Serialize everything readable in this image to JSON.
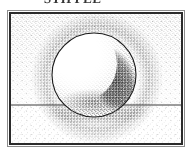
{
  "figure": {
    "title_fragment": "STIPPLE",
    "frame": {
      "x": 7,
      "y": 10,
      "width": 178,
      "height": 137,
      "outer_border_color": "#8d8d8d",
      "inner_border_color": "#2b2b2b",
      "inner_border_width": 2,
      "background_color": "#ffffff"
    },
    "technique": "stipple",
    "ink_color": "#111111",
    "paper_color": "#ffffff"
  },
  "scene": {
    "subject": "sphere",
    "sphere": {
      "center_x": 92,
      "center_y": 73,
      "radius": 42,
      "outline_color": "#1a1a1a",
      "light_direction": "upper-left",
      "highlight_x": 72,
      "highlight_y": 50,
      "terminator_side": "right",
      "reflected_light": "bottom-left"
    },
    "ground": {
      "horizon_y": 100,
      "horizon_color": "#3a3a3a",
      "above_label": "wall",
      "below_label": "table"
    },
    "cast_shadow": {
      "center_x": 96,
      "center_y": 110,
      "radius_x": 52,
      "radius_y": 13
    },
    "background_stipple": {
      "upper_density": "medium",
      "lower_density": "light"
    }
  }
}
